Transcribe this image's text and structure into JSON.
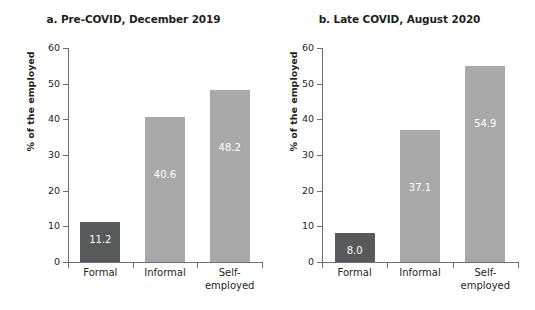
{
  "chart_data": [
    {
      "type": "bar",
      "panel_id": "a",
      "title": "a. Pre-COVID, December 2019",
      "categories": [
        "Formal",
        "Informal",
        "Self-employed"
      ],
      "category_lines": [
        [
          "Formal"
        ],
        [
          "Informal"
        ],
        [
          "Self-",
          "employed"
        ]
      ],
      "values": [
        11.2,
        48.2,
        48.2
      ],
      "series": [
        {
          "name": "% of the employed",
          "values": [
            11.2,
            40.6,
            48.2
          ],
          "labels": [
            "11.2",
            "40.6",
            "48.2"
          ]
        }
      ],
      "xlabel": "",
      "ylabel": "% of the employed",
      "ylim": [
        0,
        60
      ],
      "yticks": [
        0,
        10,
        20,
        30,
        40,
        50,
        60
      ],
      "ytick_labels": [
        "0",
        "10",
        "20",
        "30",
        "40",
        "50",
        "60"
      ],
      "grid": false,
      "legend": "none",
      "bar_colors": [
        "#58595b",
        "#a9a9a9",
        "#a9a9a9"
      ],
      "value_label_color": "#ffffff"
    },
    {
      "type": "bar",
      "panel_id": "b",
      "title": "b. Late COVID, August 2020",
      "categories": [
        "Formal",
        "Informal",
        "Self-employed"
      ],
      "category_lines": [
        [
          "Formal"
        ],
        [
          "Informal"
        ],
        [
          "Self-",
          "employed"
        ]
      ],
      "values": [
        8.0,
        37.1,
        54.9
      ],
      "series": [
        {
          "name": "% of the employed",
          "values": [
            8.0,
            37.1,
            54.9
          ],
          "labels": [
            "8.0",
            "37.1",
            "54.9"
          ]
        }
      ],
      "xlabel": "",
      "ylabel": "% of the employed",
      "ylim": [
        0,
        60
      ],
      "yticks": [
        0,
        10,
        20,
        30,
        40,
        50,
        60
      ],
      "ytick_labels": [
        "0",
        "10",
        "20",
        "30",
        "40",
        "50",
        "60"
      ],
      "grid": false,
      "legend": "none",
      "bar_colors": [
        "#58595b",
        "#a9a9a9",
        "#a9a9a9"
      ],
      "value_label_color": "#ffffff"
    }
  ],
  "colors": {
    "background": "#ffffff",
    "text": "#231f20",
    "axis": "#6d6e71",
    "bar_dark": "#58595b",
    "bar_light": "#a9a9a9"
  }
}
